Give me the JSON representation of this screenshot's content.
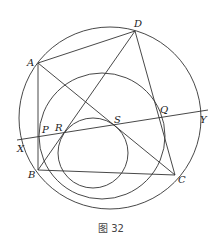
{
  "figure": {
    "caption": "图 32",
    "points": {
      "A": "A",
      "B": "B",
      "C": "C",
      "D": "D",
      "P": "P",
      "Q": "Q",
      "R": "R",
      "S": "S",
      "X": "X",
      "Y": "Y"
    },
    "line_color": "#333333"
  }
}
